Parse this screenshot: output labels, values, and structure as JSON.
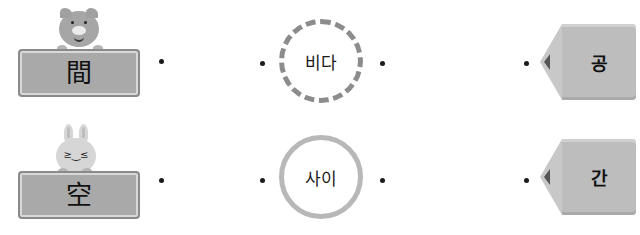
{
  "rows": [
    {
      "hanja": "間",
      "mascot": "pig-icon",
      "word": "비다",
      "syllable": "공"
    },
    {
      "hanja": "空",
      "mascot": "bunny-icon",
      "word": "사이",
      "syllable": "간"
    }
  ],
  "colors": {
    "board": "#a9a9a9",
    "ring_dashed": "#8c8c8c",
    "ring_solid": "#b8b8b8",
    "pencil": "#bdbdbd",
    "dot": "#1a1a1a"
  }
}
